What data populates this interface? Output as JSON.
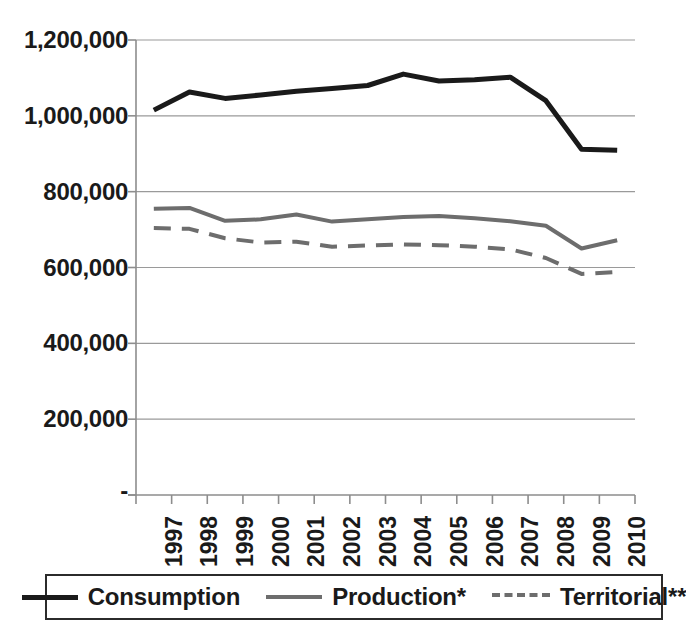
{
  "chart_data": {
    "type": "line",
    "title": "",
    "xlabel": "",
    "ylabel": "",
    "grid": true,
    "legend_position": "bottom",
    "x": [
      "1997",
      "1998",
      "1999",
      "2000",
      "2001",
      "2002",
      "2003",
      "2004",
      "2005",
      "2006",
      "2007",
      "2008",
      "2009",
      "2010"
    ],
    "categories": [
      "1997",
      "1998",
      "1999",
      "2000",
      "2001",
      "2002",
      "2003",
      "2004",
      "2005",
      "2006",
      "2007",
      "2008",
      "2009",
      "2010"
    ],
    "ylim": [
      0,
      1200000
    ],
    "ytick_values": [
      1200000,
      1000000,
      800000,
      600000,
      400000,
      200000,
      0
    ],
    "ytick_labels": [
      "1,200,000",
      "1,000,000",
      "800,000",
      "600,000",
      "400,000",
      "200,000",
      "-"
    ],
    "series": [
      {
        "name": "Consumption",
        "style": "solid",
        "color": "#1a1a1a",
        "width": 5,
        "values": [
          1015000,
          1063000,
          1046000,
          1055000,
          1065000,
          1072000,
          1080000,
          1110000,
          1092000,
          1095000,
          1102000,
          1040000,
          912000,
          909000
        ]
      },
      {
        "name": "Production*",
        "style": "solid",
        "color": "#6d6d6d",
        "width": 4,
        "values": [
          755000,
          757000,
          723000,
          727000,
          740000,
          721000,
          727000,
          733000,
          736000,
          730000,
          722000,
          710000,
          650000,
          672000
        ]
      },
      {
        "name": "Territorial**",
        "style": "dashed",
        "color": "#6d6d6d",
        "width": 4,
        "values": [
          704000,
          702000,
          677000,
          666000,
          668000,
          655000,
          658000,
          661000,
          659000,
          655000,
          648000,
          625000,
          583000,
          588000
        ]
      }
    ]
  },
  "legend": {
    "items": [
      {
        "label": "Consumption",
        "swatch": "solid-dark"
      },
      {
        "label": "Production*",
        "swatch": "solid-gray"
      },
      {
        "label": "Territorial**",
        "swatch": "dashed-gray"
      }
    ]
  },
  "axes": {
    "x_axis_name": "year-axis",
    "y_axis_name": "value-axis"
  }
}
